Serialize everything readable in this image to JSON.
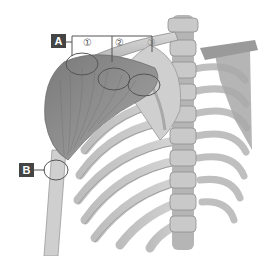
{
  "figure": {
    "labels": {
      "A": "A",
      "B": "B"
    },
    "numbers": [
      "①",
      "②",
      "③"
    ],
    "colors": {
      "label_bg": "#444444",
      "label_text": "#ffffff",
      "callout_line": "#555555",
      "muscle": "#8a8a8a",
      "bone": "#c4c4c4",
      "background": "#ffffff"
    }
  }
}
